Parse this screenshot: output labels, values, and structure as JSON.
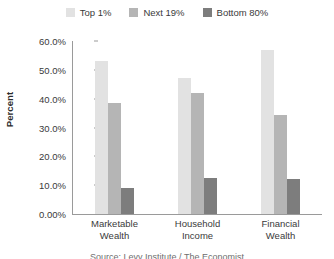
{
  "chart_data": {
    "type": "bar",
    "title": "",
    "xlabel": "",
    "ylabel": "Percent",
    "ylim": [
      0,
      60
    ],
    "grid": false,
    "legend_position": "top-center",
    "categories": [
      "Marketable Wealth",
      "Household Income",
      "Financial Wealth"
    ],
    "category_lines": [
      [
        "Marketable",
        "Wealth"
      ],
      [
        "Household",
        "Income"
      ],
      [
        "Financial",
        "Wealth"
      ]
    ],
    "ytick_labels": [
      "0.00%",
      "10.0%",
      "20.0%",
      "30.0%",
      "40.0%",
      "50.0%",
      "60.0%"
    ],
    "ytick_values": [
      0,
      10,
      20,
      30,
      40,
      50,
      60
    ],
    "series": [
      {
        "name": "Top 1%",
        "color": "#e2e2e2",
        "values": [
          53.0,
          47.0,
          57.0
        ]
      },
      {
        "name": "Next 19%",
        "color": "#b5b5b5",
        "values": [
          38.5,
          42.0,
          34.5
        ]
      },
      {
        "name": "Bottom 80%",
        "color": "#7d7d7d",
        "values": [
          9.0,
          12.5,
          12.0
        ]
      }
    ]
  },
  "legend": {
    "items": [
      {
        "label": "Top 1%",
        "color": "#e2e2e2"
      },
      {
        "label": "Next 19%",
        "color": "#b5b5b5"
      },
      {
        "label": "Bottom 80%",
        "color": "#7d7d7d"
      }
    ]
  },
  "axes": {
    "y_title": "Percent"
  },
  "caption": {
    "text": "Source: Levy Institute / The Economist"
  }
}
